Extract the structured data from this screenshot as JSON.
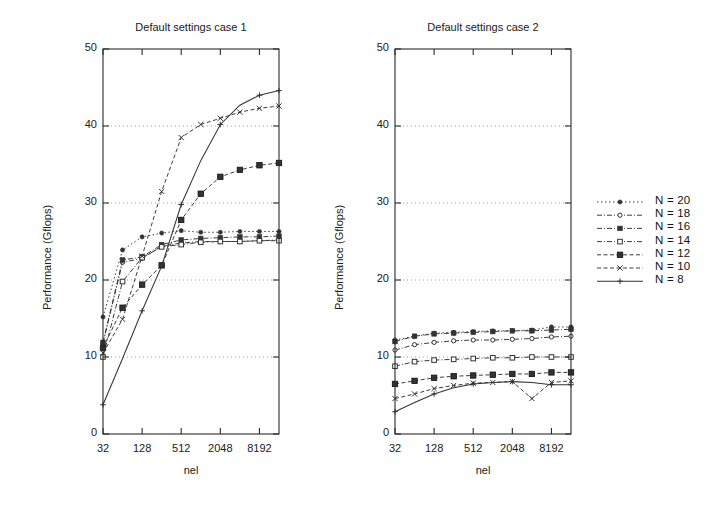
{
  "figure": {
    "width": 724,
    "height": 509,
    "background": "#ffffff",
    "ink_color": "#2b2b2b"
  },
  "legend": {
    "position": "right-outside",
    "entries": [
      {
        "label": "N = 20",
        "marker": "filled-circle",
        "linestyle": "dotted"
      },
      {
        "label": "N = 18",
        "marker": "open-circle",
        "linestyle": "dash-dot"
      },
      {
        "label": "N = 16",
        "marker": "filled-square",
        "linestyle": "dash-dot"
      },
      {
        "label": "N = 14",
        "marker": "open-square",
        "linestyle": "dash-dot"
      },
      {
        "label": "N = 12",
        "marker": "filled-square-bold",
        "linestyle": "dashed"
      },
      {
        "label": "N = 10",
        "marker": "cross-x",
        "linestyle": "dashed"
      },
      {
        "label": "N =  8",
        "marker": "plus",
        "linestyle": "solid"
      }
    ]
  },
  "chart_data": [
    {
      "type": "line",
      "title": "Default settings case 1",
      "xlabel": "nel",
      "ylabel": "Performance (Gflops)",
      "xscale": "log2",
      "xlim": [
        32,
        16384
      ],
      "ylim": [
        0,
        50
      ],
      "yticks": [
        0,
        10,
        20,
        30,
        40,
        50
      ],
      "xticks": [
        32,
        128,
        512,
        2048,
        8192
      ],
      "xtick_labels": [
        "32",
        "128",
        "512",
        "2048",
        "8192"
      ],
      "grid": "horizontal-dotted",
      "x": [
        32,
        64,
        128,
        256,
        512,
        1024,
        2048,
        4096,
        8192,
        16384
      ],
      "series": [
        {
          "name": "N = 20",
          "marker": "filled-circle",
          "linestyle": "dotted",
          "values": [
            15.2,
            23.9,
            25.6,
            26.1,
            26.4,
            26.2,
            26.2,
            26.3,
            26.3,
            26.3
          ]
        },
        {
          "name": "N = 18",
          "marker": "open-circle",
          "linestyle": "dash-dot",
          "values": [
            11.8,
            22.3,
            22.8,
            24.4,
            24.8,
            25.0,
            25.0,
            25.0,
            25.1,
            25.2
          ]
        },
        {
          "name": "N = 16",
          "marker": "filled-square",
          "linestyle": "dash-dot",
          "values": [
            11.9,
            22.6,
            23.0,
            24.6,
            25.2,
            25.4,
            25.5,
            25.6,
            25.6,
            25.7
          ]
        },
        {
          "name": "N = 14",
          "marker": "open-square",
          "linestyle": "dash-dot",
          "values": [
            10.0,
            19.8,
            22.9,
            24.3,
            24.6,
            24.9,
            25.0,
            25.0,
            25.1,
            25.1
          ]
        },
        {
          "name": "N = 12",
          "marker": "filled-square-bold",
          "linestyle": "dashed",
          "values": [
            11.2,
            16.4,
            19.4,
            21.9,
            27.8,
            31.2,
            33.4,
            34.3,
            34.9,
            35.2
          ]
        },
        {
          "name": "N = 10",
          "marker": "cross-x",
          "linestyle": "dashed",
          "values": [
            10.5,
            14.9,
            23.1,
            31.5,
            38.5,
            40.2,
            41.0,
            41.8,
            42.3,
            42.6
          ]
        },
        {
          "name": "N =  8",
          "marker": "plus",
          "linestyle": "solid",
          "values": [
            3.8,
            9.8,
            16.0,
            21.8,
            29.8,
            35.5,
            40.2,
            42.7,
            44.0,
            44.6
          ]
        }
      ]
    },
    {
      "type": "line",
      "title": "Default settings case 2",
      "xlabel": "nel",
      "ylabel": "Performance (Gflops)",
      "xscale": "log2",
      "xlim": [
        32,
        16384
      ],
      "ylim": [
        0,
        50
      ],
      "yticks": [
        0,
        10,
        20,
        30,
        40,
        50
      ],
      "xticks": [
        32,
        128,
        512,
        2048,
        8192
      ],
      "xtick_labels": [
        "32",
        "128",
        "512",
        "2048",
        "8192"
      ],
      "grid": "horizontal-dotted",
      "x": [
        32,
        64,
        128,
        256,
        512,
        1024,
        2048,
        4096,
        8192,
        16384
      ],
      "series": [
        {
          "name": "N = 20",
          "marker": "filled-circle",
          "linestyle": "dotted",
          "values": [
            12.2,
            12.7,
            13.1,
            13.2,
            13.3,
            13.4,
            13.4,
            13.5,
            13.9,
            13.9
          ]
        },
        {
          "name": "N = 18",
          "marker": "open-circle",
          "linestyle": "dash-dot",
          "values": [
            10.9,
            11.6,
            11.9,
            12.1,
            12.2,
            12.2,
            12.3,
            12.4,
            12.6,
            12.7
          ]
        },
        {
          "name": "N = 16",
          "marker": "filled-square",
          "linestyle": "dash-dot",
          "values": [
            12.0,
            12.7,
            13.0,
            13.1,
            13.2,
            13.3,
            13.4,
            13.4,
            13.5,
            13.6
          ]
        },
        {
          "name": "N = 14",
          "marker": "open-square",
          "linestyle": "dash-dot",
          "values": [
            8.8,
            9.4,
            9.6,
            9.7,
            9.8,
            9.9,
            9.9,
            10.0,
            10.0,
            10.0
          ]
        },
        {
          "name": "N = 12",
          "marker": "filled-square-bold",
          "linestyle": "dashed",
          "values": [
            6.5,
            6.9,
            7.3,
            7.5,
            7.6,
            7.7,
            7.8,
            7.8,
            8.0,
            8.0
          ]
        },
        {
          "name": "N = 10",
          "marker": "cross-x",
          "linestyle": "dashed",
          "values": [
            4.6,
            5.2,
            5.9,
            6.3,
            6.6,
            6.7,
            6.8,
            4.6,
            6.7,
            6.9
          ]
        },
        {
          "name": "N =  8",
          "marker": "plus",
          "linestyle": "solid",
          "values": [
            2.9,
            4.1,
            5.2,
            6.0,
            6.5,
            6.7,
            6.8,
            6.7,
            6.4,
            6.4
          ]
        }
      ]
    }
  ]
}
